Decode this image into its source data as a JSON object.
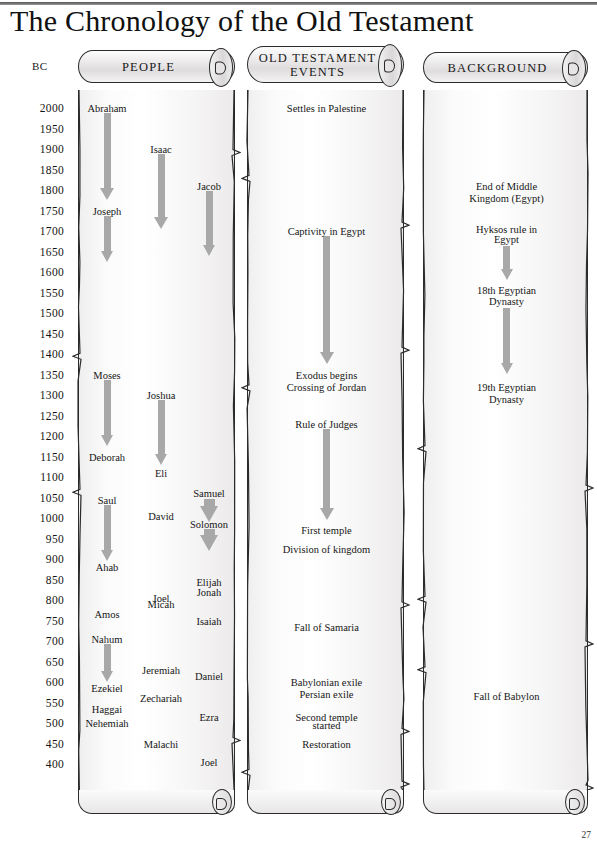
{
  "document": {
    "title": "The Chronology of the Old Testament",
    "page_number": "27",
    "bc_axis_label": "BC"
  },
  "columns": [
    {
      "id": "people",
      "header": "PEOPLE"
    },
    {
      "id": "events",
      "header": "OLD TESTAMENT\nEVENTS",
      "header_line1": "OLD TESTAMENT",
      "header_line2": "EVENTS"
    },
    {
      "id": "background",
      "header": "BACKGROUND"
    }
  ],
  "chart_data": {
    "type": "timeline",
    "title": "The Chronology of the Old Testament",
    "ylabel": "BC",
    "axis_direction": "descending",
    "ylim": [
      2000,
      400
    ],
    "tick_step": 50,
    "tick_labels": [
      "2000",
      "1950",
      "1900",
      "1850",
      "1800",
      "1750",
      "1700",
      "1650",
      "1600",
      "1550",
      "1500",
      "1450",
      "1400",
      "1350",
      "1300",
      "1250",
      "1200",
      "1150",
      "1100",
      "1050",
      "1000",
      "950",
      "900",
      "850",
      "800",
      "750",
      "700",
      "650",
      "600",
      "550",
      "500",
      "450",
      "400"
    ],
    "lanes": [
      {
        "name": "PEOPLE",
        "entries": [
          {
            "label": "Abraham",
            "year": 2000,
            "track": 0
          },
          {
            "label": "Isaac",
            "year": 1900,
            "track": 1
          },
          {
            "label": "Jacob",
            "year": 1810,
            "track": 2
          },
          {
            "label": "Joseph",
            "year": 1750,
            "track": 0
          },
          {
            "label": "Moses",
            "year": 1350,
            "track": 0
          },
          {
            "label": "Joshua",
            "year": 1300,
            "track": 1
          },
          {
            "label": "Deborah",
            "year": 1150,
            "track": 0
          },
          {
            "label": "Eli",
            "year": 1110,
            "track": 1
          },
          {
            "label": "Samuel",
            "year": 1060,
            "track": 2
          },
          {
            "label": "Saul",
            "year": 1045,
            "track": 0
          },
          {
            "label": "David",
            "year": 1005,
            "track": 1
          },
          {
            "label": "Solomon",
            "year": 985,
            "track": 2
          },
          {
            "label": "Ahab",
            "year": 880,
            "track": 0
          },
          {
            "label": "Elijah",
            "year": 845,
            "track": 2
          },
          {
            "label": "Jonah",
            "year": 820,
            "track": 2
          },
          {
            "label": "Joel",
            "year": 805,
            "track": 1
          },
          {
            "label": "Micah",
            "year": 790,
            "track": 1
          },
          {
            "label": "Amos",
            "year": 765,
            "track": 0
          },
          {
            "label": "Isaiah",
            "year": 750,
            "track": 2
          },
          {
            "label": "Nahum",
            "year": 705,
            "track": 0
          },
          {
            "label": "Jeremiah",
            "year": 630,
            "track": 1
          },
          {
            "label": "Daniel",
            "year": 615,
            "track": 2
          },
          {
            "label": "Ezekiel",
            "year": 585,
            "track": 0
          },
          {
            "label": "Zechariah",
            "year": 560,
            "track": 1
          },
          {
            "label": "Haggai",
            "year": 535,
            "track": 0
          },
          {
            "label": "Ezra",
            "year": 515,
            "track": 2
          },
          {
            "label": "Nehemiah",
            "year": 500,
            "track": 0
          },
          {
            "label": "Malachi",
            "year": 450,
            "track": 1
          },
          {
            "label": "Joel",
            "year": 405,
            "track": 2
          }
        ],
        "arrows": [
          {
            "from_label": "Abraham",
            "from_year": 1990,
            "to_year": 1775
          },
          {
            "from_label": "Isaac",
            "from_year": 1890,
            "to_year": 1705
          },
          {
            "from_label": "Jacob",
            "from_year": 1800,
            "to_year": 1640
          },
          {
            "from_label": "Joseph",
            "from_year": 1740,
            "to_year": 1625
          },
          {
            "from_label": "Moses",
            "from_year": 1340,
            "to_year": 1175
          },
          {
            "from_label": "Joshua",
            "from_year": 1290,
            "to_year": 1130
          },
          {
            "from_label": "Saul",
            "from_year": 1035,
            "to_year": 895
          },
          {
            "from_label": "Samuel",
            "from_year": 1050,
            "to_year": 1000
          },
          {
            "from_label": "Solomon",
            "from_year": 975,
            "to_year": 930
          },
          {
            "from_label": "Nahum",
            "from_year": 695,
            "to_year": 600
          }
        ]
      },
      {
        "name": "OLD TESTAMENT EVENTS",
        "entries": [
          {
            "label": "Settles in Palestine",
            "year": 2000
          },
          {
            "label": "Captivity in Egypt",
            "year": 1700
          },
          {
            "label": "Exodus begins",
            "year": 1350
          },
          {
            "label": "Crossing of Jordan",
            "year": 1320
          },
          {
            "label": "Rule of Judges",
            "year": 1230
          },
          {
            "label": "First temple",
            "year": 970
          },
          {
            "label": "Division of kingdom",
            "year": 925
          },
          {
            "label": "Fall of Samaria",
            "year": 735
          },
          {
            "label": "Babylonian exile",
            "year": 600
          },
          {
            "label": "Persian exile",
            "year": 570
          },
          {
            "label": "Second temple",
            "year": 515
          },
          {
            "label": "started",
            "year": 495
          },
          {
            "label": "Restoration",
            "year": 450
          }
        ],
        "arrows": [
          {
            "from_label": "Captivity in Egypt",
            "from_year": 1690,
            "to_year": 1375
          },
          {
            "from_label": "Rule of Judges",
            "from_year": 1220,
            "to_year": 995
          }
        ]
      },
      {
        "name": "BACKGROUND",
        "entries": [
          {
            "label": "End of Middle",
            "year": 1810
          },
          {
            "label": "Kingdom (Egypt)",
            "year": 1780
          },
          {
            "label": "Hyksos rule in",
            "year": 1705
          },
          {
            "label": "Egypt",
            "year": 1680
          },
          {
            "label": "18th Egyptian",
            "year": 1555
          },
          {
            "label": "Dynasty",
            "year": 1530
          },
          {
            "label": "19th Egyptian",
            "year": 1320
          },
          {
            "label": "Dynasty",
            "year": 1290
          },
          {
            "label": "Fall of Babylon",
            "year": 565
          }
        ],
        "arrows": [
          {
            "from_label": "Hyksos rule in",
            "from_year": 1665,
            "to_year": 1580
          },
          {
            "from_label": "18th Egyptian",
            "from_year": 1515,
            "to_year": 1350
          }
        ]
      }
    ]
  },
  "colors": {
    "arrow": "#a8a8a8",
    "ink": "#1a1a1a",
    "scroll_outline": "#2b2b2b"
  }
}
